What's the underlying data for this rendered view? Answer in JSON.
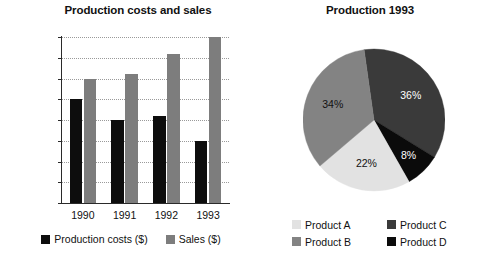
{
  "chart_data": [
    {
      "type": "bar",
      "title": "Production costs and sales",
      "xlabel": "",
      "ylabel": "",
      "categories": [
        "1990",
        "1991",
        "1992",
        "1993"
      ],
      "yticks": [
        "0",
        "10 000",
        "20 000",
        "30 000",
        "40 000",
        "50 000",
        "60 000",
        "70 000",
        "80 000"
      ],
      "ytick_values": [
        0,
        10000,
        20000,
        30000,
        40000,
        50000,
        60000,
        70000,
        80000
      ],
      "ylim": [
        0,
        80000
      ],
      "grid": true,
      "legend_position": "bottom",
      "series": [
        {
          "name": "Production costs ($)",
          "color": "#0d0d0d",
          "values": [
            50000,
            40000,
            42000,
            30000
          ]
        },
        {
          "name": "Sales ($)",
          "color": "#7d7d7d",
          "values": [
            60000,
            62000,
            72000,
            80000
          ]
        }
      ]
    },
    {
      "type": "pie",
      "title": "Production 1993",
      "legend_position": "bottom",
      "labels": [
        "Product A",
        "Product B",
        "Product C",
        "Product D"
      ],
      "values": [
        22,
        34,
        36,
        8
      ],
      "value_labels": [
        "22%",
        "34%",
        "36%",
        "8%"
      ],
      "colors": [
        "#e2e2e2",
        "#838383",
        "#3a3a3a",
        "#0b0b0b"
      ]
    }
  ],
  "bar_chart": {
    "title": "Production costs and sales",
    "y_ticks": [
      {
        "label": "80 000",
        "value": 80000
      },
      {
        "label": "70 000",
        "value": 70000
      },
      {
        "label": "60 000",
        "value": 60000
      },
      {
        "label": "50 000",
        "value": 50000
      },
      {
        "label": "40 000",
        "value": 40000
      },
      {
        "label": "30 000",
        "value": 30000
      },
      {
        "label": "20 000",
        "value": 20000
      },
      {
        "label": "10 000",
        "value": 10000
      },
      {
        "label": "0",
        "value": 0
      }
    ],
    "x_ticks": [
      "1990",
      "1991",
      "1992",
      "1993"
    ],
    "groups": [
      {
        "year": "1990",
        "costs": 50000,
        "sales": 60000
      },
      {
        "year": "1991",
        "costs": 40000,
        "sales": 62000
      },
      {
        "year": "1992",
        "costs": 42000,
        "sales": 72000
      },
      {
        "year": "1993",
        "costs": 30000,
        "sales": 80000
      }
    ],
    "legend": [
      {
        "label": "Production costs ($)",
        "color": "#0d0d0d"
      },
      {
        "label": "Sales ($)",
        "color": "#7d7d7d"
      }
    ]
  },
  "pie_chart": {
    "title": "Production 1993",
    "slices": [
      {
        "label": "Product C",
        "percent_label": "36%",
        "percent": 36,
        "color": "#3a3a3a"
      },
      {
        "label": "Product D",
        "percent_label": "8%",
        "percent": 8,
        "color": "#0b0b0b"
      },
      {
        "label": "Product A",
        "percent_label": "22%",
        "percent": 22,
        "color": "#e2e2e2"
      },
      {
        "label": "Product B",
        "percent_label": "34%",
        "percent": 34,
        "color": "#838383"
      }
    ],
    "legend": [
      {
        "label": "Product A",
        "color": "#e2e2e2"
      },
      {
        "label": "Product C",
        "color": "#3a3a3a"
      },
      {
        "label": "Product B",
        "color": "#838383"
      },
      {
        "label": "Product D",
        "color": "#0b0b0b"
      }
    ]
  }
}
